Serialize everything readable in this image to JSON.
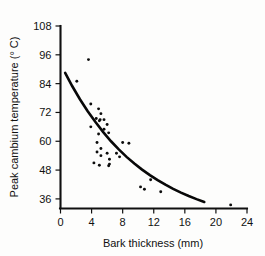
{
  "chart_data": {
    "type": "scatter",
    "title": "",
    "xlabel": "Bark thickness (mm)",
    "ylabel": "Peak cambium temperature (° C)",
    "xlim": [
      0,
      24
    ],
    "ylim": [
      32,
      108
    ],
    "xticks": [
      0,
      4,
      8,
      12,
      16,
      20,
      24
    ],
    "yticks": [
      36,
      48,
      60,
      72,
      84,
      96,
      108
    ],
    "grid": false,
    "legend": null,
    "point_color": "#0d0d0d",
    "curve_color": "#080808",
    "axis_color": "#101010",
    "background_color": "#fdfdfc",
    "points": [
      [
        3.6,
        94.0
      ],
      [
        2.1,
        85.0
      ],
      [
        3.9,
        75.5
      ],
      [
        4.9,
        73.5
      ],
      [
        5.2,
        71.5
      ],
      [
        4.6,
        69.5
      ],
      [
        5.1,
        69.0
      ],
      [
        5.6,
        69.0
      ],
      [
        5.0,
        68.5
      ],
      [
        6.0,
        67.0
      ],
      [
        3.9,
        66.0
      ],
      [
        5.6,
        65.0
      ],
      [
        6.2,
        63.5
      ],
      [
        4.9,
        63.0
      ],
      [
        4.7,
        59.5
      ],
      [
        8.0,
        59.5
      ],
      [
        8.8,
        59.2
      ],
      [
        5.2,
        57.0
      ],
      [
        4.7,
        55.5
      ],
      [
        6.0,
        55.0
      ],
      [
        7.2,
        55.0
      ],
      [
        5.2,
        54.0
      ],
      [
        7.6,
        53.5
      ],
      [
        6.3,
        52.5
      ],
      [
        4.3,
        51.0
      ],
      [
        6.3,
        50.5
      ],
      [
        5.0,
        50.0
      ],
      [
        6.2,
        49.8
      ],
      [
        11.6,
        44.0
      ],
      [
        10.3,
        41.0
      ],
      [
        10.8,
        40.0
      ],
      [
        12.9,
        39.0
      ],
      [
        21.9,
        33.5
      ]
    ],
    "fit_curve": {
      "description": "exponential decay fit line",
      "x_start": 0.6,
      "x_end": 18.5,
      "points": [
        [
          0.6,
          88.5
        ],
        [
          1.5,
          83.0
        ],
        [
          2.5,
          77.5
        ],
        [
          3.5,
          72.5
        ],
        [
          4.5,
          68.0
        ],
        [
          5.5,
          63.8
        ],
        [
          6.5,
          60.0
        ],
        [
          7.5,
          56.6
        ],
        [
          8.5,
          53.5
        ],
        [
          9.5,
          50.7
        ],
        [
          10.5,
          48.2
        ],
        [
          11.5,
          45.9
        ],
        [
          12.5,
          43.8
        ],
        [
          13.5,
          41.9
        ],
        [
          14.5,
          40.2
        ],
        [
          15.5,
          38.6
        ],
        [
          16.5,
          37.2
        ],
        [
          17.5,
          35.9
        ],
        [
          18.5,
          34.7
        ]
      ]
    }
  }
}
